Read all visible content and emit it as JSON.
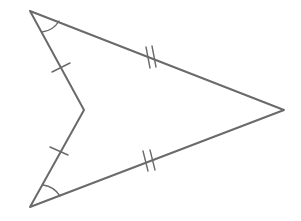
{
  "figure": {
    "name": "congruent-triangles-arrowhead-figure",
    "canvas": {
      "width": 301,
      "height": 221,
      "background": "#ffffff"
    },
    "style": {
      "stroke_color": "#6a6a6a",
      "stroke_width": 2,
      "tick_color": "#6a6a6a",
      "tick_width": 1.4,
      "arc_color": "#6a6a6a",
      "arc_width": 1.4
    },
    "vertices": [
      {
        "id": "A",
        "label": "top-left-apex",
        "x": 30,
        "y": 11
      },
      {
        "id": "B",
        "label": "right-point",
        "x": 284,
        "y": 110
      },
      {
        "id": "C",
        "label": "concave-middle",
        "x": 84,
        "y": 110
      },
      {
        "id": "D",
        "label": "bottom-left-apex",
        "x": 30,
        "y": 207
      }
    ],
    "outline_path": "M 30 11 L 284 110 L 30 207 L 84 110 Z",
    "segments": [
      {
        "id": "AB",
        "name": "upper-long-edge",
        "from": "A",
        "to": "B",
        "x1": 30,
        "y1": 11,
        "x2": 284,
        "y2": 110,
        "tick_count": 2
      },
      {
        "id": "BD",
        "name": "lower-long-edge",
        "from": "B",
        "to": "D",
        "x1": 284,
        "y1": 110,
        "x2": 30,
        "y2": 207,
        "tick_count": 2
      },
      {
        "id": "AC",
        "name": "upper-short-edge",
        "from": "A",
        "to": "C",
        "x1": 30,
        "y1": 11,
        "x2": 84,
        "y2": 110,
        "tick_count": 1
      },
      {
        "id": "CD",
        "name": "lower-short-edge",
        "from": "C",
        "to": "D",
        "x1": 84,
        "y1": 110,
        "x2": 30,
        "y2": 207,
        "tick_count": 1
      }
    ],
    "tick_marks": [
      {
        "id": "tick-upper-short",
        "name": "single-tick-upper-short-edge",
        "segment": "AC",
        "count": 1,
        "center_x": 61,
        "center_y": 68,
        "marks": [
          {
            "x1": 52,
            "y1": 72,
            "x2": 70,
            "y2": 63
          }
        ]
      },
      {
        "id": "tick-lower-short",
        "name": "single-tick-lower-short-edge",
        "segment": "CD",
        "count": 1,
        "center_x": 59,
        "center_y": 151,
        "marks": [
          {
            "x1": 50,
            "y1": 147,
            "x2": 68,
            "y2": 155
          }
        ]
      },
      {
        "id": "tick-upper-long",
        "name": "double-tick-upper-long-edge",
        "segment": "AB",
        "count": 2,
        "center_x": 151,
        "center_y": 58,
        "marks": [
          {
            "x1": 146,
            "y1": 47,
            "x2": 150,
            "y2": 68
          },
          {
            "x1": 152,
            "y1": 46,
            "x2": 156,
            "y2": 67
          }
        ]
      },
      {
        "id": "tick-lower-long",
        "name": "double-tick-lower-long-edge",
        "segment": "BD",
        "count": 2,
        "center_x": 149,
        "center_y": 161,
        "marks": [
          {
            "x1": 143,
            "y1": 151,
            "x2": 148,
            "y2": 171
          },
          {
            "x1": 150,
            "y1": 150,
            "x2": 155,
            "y2": 170
          }
        ]
      }
    ],
    "angle_arcs": [
      {
        "id": "arc-A",
        "name": "angle-arc-top-left-apex",
        "vertex": "A",
        "tick_count": 1,
        "path": "M 42 32 A 23 23 0 0 0 59 21"
      },
      {
        "id": "arc-D",
        "name": "angle-arc-bottom-left-apex",
        "vertex": "D",
        "tick_count": 1,
        "path": "M 43 185 A 24 24 0 0 1 60 196"
      }
    ]
  }
}
